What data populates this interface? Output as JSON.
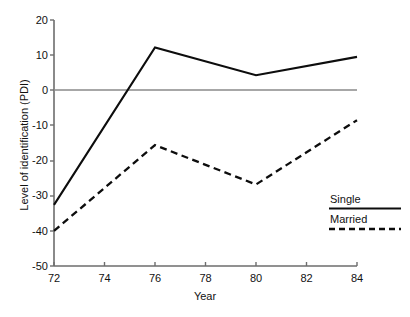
{
  "chart_data": {
    "type": "line",
    "title": "",
    "subtitle": "",
    "xlabel": "Year",
    "ylabel": "Level of identification (PDI)",
    "x": [
      72,
      76,
      80,
      84
    ],
    "xlim": [
      72,
      84
    ],
    "ylim": [
      -50,
      20
    ],
    "xticks": [
      72,
      74,
      76,
      78,
      80,
      82,
      84
    ],
    "xtick_labels": [
      "72",
      "74",
      "76",
      "78",
      "80",
      "82",
      "84"
    ],
    "yticks": [
      20,
      10,
      0,
      -10,
      -20,
      -30,
      -40,
      -50
    ],
    "ytick_labels": [
      "20",
      "10",
      "0",
      "-10",
      "-20",
      "-30",
      "-40",
      "-50"
    ],
    "grid": false,
    "legend_position": "bottom-right",
    "reference_lines": [
      {
        "axis": "y",
        "value": 0,
        "color": "#8a8a8a"
      }
    ],
    "series": [
      {
        "name": "Single",
        "style": "solid",
        "color": "#0d0d0d",
        "x": [
          72,
          76,
          80,
          84
        ],
        "values": [
          -32.6,
          12.2,
          4.3,
          9.5
        ]
      },
      {
        "name": "Married",
        "style": "dashed",
        "color": "#0d0d0d",
        "x": [
          72,
          76,
          80,
          84
        ],
        "values": [
          -40.0,
          -15.6,
          -26.8,
          -8.5
        ]
      }
    ]
  },
  "legend": {
    "items": [
      {
        "label": "Single",
        "style": "solid"
      },
      {
        "label": "Married",
        "style": "dashed"
      }
    ]
  },
  "axes": {
    "y_title": "Level of identification (PDI)",
    "x_title": "Year"
  }
}
